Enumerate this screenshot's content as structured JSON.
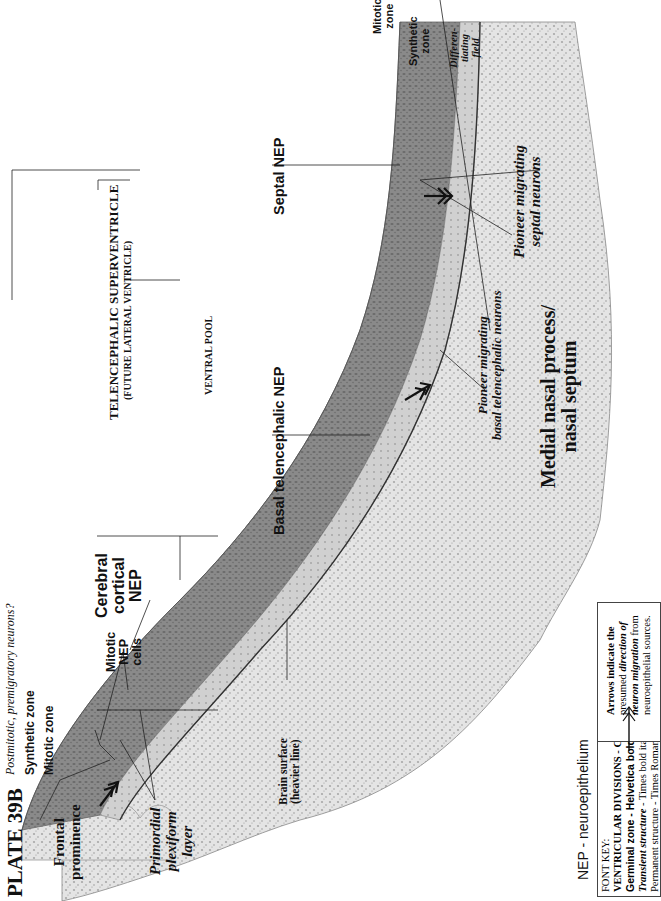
{
  "plate": {
    "title": "PLATE 39B",
    "orientation": "rotated 90 degrees counterclockwise"
  },
  "ventricle": {
    "name": "TELENCEPHALIC SUPERVENTRICLE",
    "subtitle": "(FUTURE LATERAL VENTRICLE)",
    "pool": "VENTRAL POOL"
  },
  "labels": {
    "postmitotic": "Postmitotic, premigratory neurons?",
    "synthetic_zone_left": "Synthetic zone",
    "mitotic_zone_left": "Mitotic zone",
    "mitotic_nep_cells": [
      "Mitotic",
      "NEP",
      "cells"
    ],
    "cerebral_cortical_nep": [
      "Cerebral",
      "cortical",
      "NEP"
    ],
    "basal_telencephalic_nep": "Basal telencephalic NEP",
    "septal_nep": "Septal NEP",
    "mitotic_zone_right": [
      "Mitotic",
      "zone"
    ],
    "synthetic_zone_right": [
      "Synthetic",
      "zone"
    ],
    "differentiating_field": [
      "Differen-",
      "tiating",
      "field"
    ],
    "pioneer_septal": [
      "Pioneer migrating",
      "septal neurons"
    ],
    "pioneer_basal": [
      "Pioneer migrating",
      "basal telencephalic neurons"
    ],
    "medial_nasal": [
      "Medial nasal process/",
      "nasal septum"
    ],
    "frontal_prominence": [
      "Frontal",
      "prominence"
    ],
    "primordial_plexiform": [
      "Primordial",
      "plexiform",
      "layer"
    ],
    "brain_surface": [
      "Brain surface",
      "(heavier line)"
    ]
  },
  "legend": {
    "abbreviation": "NEP - neuroepithelium",
    "font_key": {
      "heading": "FONT KEY:",
      "lines": [
        {
          "text_a": "VENTRICULAR DIVISIONS",
          "text_b": " - CAPITALS"
        },
        {
          "text_a": "Germinal zone",
          "text_b": " - Helvetica bold"
        },
        {
          "text_a": "Transient structure",
          "text_b": " - Times bold italic"
        },
        {
          "text_a": "Permanent structure",
          "text_b": " - Times Roman or ",
          "text_c": "Bold"
        }
      ]
    },
    "arrows_note": {
      "line1": "Arrows indicate the",
      "line2a": "presumed ",
      "line2b": "direction of",
      "line3a": "neuron migration",
      "line3b": " from",
      "line4": "neuroepithelial sources."
    }
  },
  "colors": {
    "background": "#ffffff",
    "mitotic_zone": "#7a7a7a",
    "synthetic_zone": "#9a9a9a",
    "differentiating_field": "#c9c9c9",
    "mesenchyme": "#dcdcdc",
    "ink": "#111111"
  }
}
